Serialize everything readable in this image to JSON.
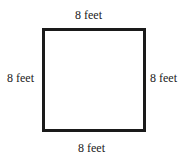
{
  "diagram": {
    "shape": "square",
    "labels": {
      "top": "8 feet",
      "left": "8 feet",
      "right": "8 feet",
      "bottom": "8 feet"
    },
    "colors": {
      "stroke": "#1a1a1a",
      "text": "#222222",
      "background": "#ffffff"
    }
  }
}
